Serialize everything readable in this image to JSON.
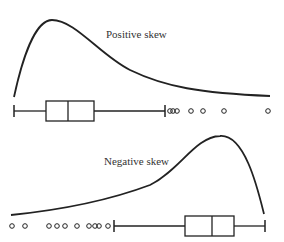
{
  "panels": [
    {
      "label": "Positive skew",
      "curve": "right-tailed density",
      "boxplot": {
        "whisker_low": 14,
        "q1": 46,
        "median": 68,
        "q3": 94,
        "whisker_high": 165,
        "outliers": [
          170,
          173,
          177,
          191,
          203,
          224,
          268
        ]
      }
    },
    {
      "label": "Negative skew",
      "curve": "left-tailed density",
      "boxplot": {
        "whisker_low": 114,
        "q1": 185,
        "median": 212,
        "q3": 234,
        "whisker_high": 265,
        "outliers": [
          12,
          25,
          49,
          57,
          65,
          77,
          89,
          95,
          99,
          108
        ]
      }
    }
  ],
  "colors": {
    "stroke": "#222222",
    "background": "#ffffff"
  }
}
